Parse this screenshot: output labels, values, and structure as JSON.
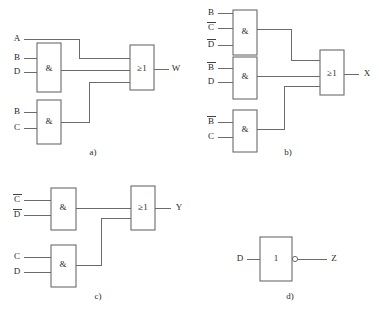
{
  "figure": {
    "type": "logic-circuit-diagram",
    "background_color": "#ffffff",
    "line_color": "#6b6b6b",
    "text_color": "#2b2b2b",
    "and_gate_symbol": "&",
    "or_gate_symbol": "≥1",
    "buffer_gate_symbol": "1"
  },
  "parts": [
    {
      "id": "a",
      "caption": "a)",
      "output_label": "W",
      "gates": [
        {
          "name": "and-gate-a1",
          "symbol": "&",
          "inputs": [
            "B",
            "D"
          ]
        },
        {
          "name": "and-gate-a2",
          "symbol": "&",
          "inputs": [
            "B",
            "C"
          ]
        },
        {
          "name": "or-gate-a",
          "symbol": "≥1",
          "inputs": [
            "A",
            "and-gate-a1",
            "and-gate-a2"
          ]
        }
      ],
      "direct_inputs": [
        "A"
      ]
    },
    {
      "id": "b",
      "caption": "b)",
      "output_label": "X",
      "gates": [
        {
          "name": "and-gate-b1",
          "symbol": "&",
          "inputs": [
            "B",
            "C̅",
            "D̅"
          ]
        },
        {
          "name": "and-gate-b2",
          "symbol": "&",
          "inputs": [
            "B̅",
            "D"
          ]
        },
        {
          "name": "and-gate-b3",
          "symbol": "&",
          "inputs": [
            "B̅",
            "C"
          ]
        },
        {
          "name": "or-gate-b",
          "symbol": "≥1",
          "inputs": [
            "and-gate-b1",
            "and-gate-b2",
            "and-gate-b3"
          ]
        }
      ],
      "direct_inputs": []
    },
    {
      "id": "c",
      "caption": "c)",
      "output_label": "Y",
      "gates": [
        {
          "name": "and-gate-c1",
          "symbol": "&",
          "inputs": [
            "C̅",
            "D̅"
          ]
        },
        {
          "name": "and-gate-c2",
          "symbol": "&",
          "inputs": [
            "C",
            "D"
          ]
        },
        {
          "name": "or-gate-c",
          "symbol": "≥1",
          "inputs": [
            "and-gate-c1",
            "and-gate-c2"
          ]
        }
      ],
      "direct_inputs": []
    },
    {
      "id": "d",
      "caption": "d)",
      "output_label": "Z",
      "gates": [
        {
          "name": "inverter-gate-d",
          "symbol": "1",
          "inputs": [
            "D"
          ],
          "inverted_output": true
        }
      ],
      "direct_inputs": [
        "D"
      ]
    }
  ],
  "labels": {
    "a": {
      "input_a": "A",
      "and1_in1": "B",
      "and1_in2": "D",
      "and2_in1": "B",
      "and2_in2": "C",
      "and1_sym": "&",
      "and2_sym": "&",
      "or_sym": "≥1",
      "output": "W",
      "caption": "a)"
    },
    "b": {
      "and1_in1": "B",
      "and1_in2": "C",
      "and1_in3": "D",
      "and2_in1": "B",
      "and2_in2": "D",
      "and3_in1": "B",
      "and3_in2": "C",
      "and1_sym": "&",
      "and2_sym": "&",
      "and3_sym": "&",
      "or_sym": "≥1",
      "output": "X",
      "caption": "b)"
    },
    "c": {
      "and1_in1": "C",
      "and1_in2": "D",
      "and2_in1": "C",
      "and2_in2": "D",
      "and1_sym": "&",
      "and2_sym": "&",
      "or_sym": "≥1",
      "output": "Y",
      "caption": "c)"
    },
    "d": {
      "input": "D",
      "gate_sym": "1",
      "output": "Z",
      "caption": "d)"
    }
  }
}
